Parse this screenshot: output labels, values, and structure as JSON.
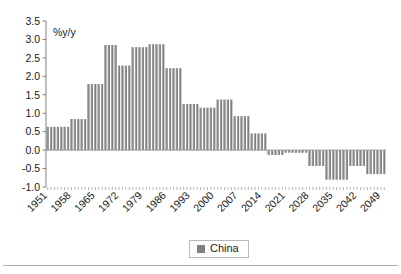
{
  "chart_data": {
    "type": "bar",
    "title": "",
    "subtitle": "",
    "xlabel": "",
    "ylabel": "%y/y",
    "ylim": [
      -1.0,
      3.5
    ],
    "ytick_labels": [
      "3.5",
      "3.0",
      "2.5",
      "2.0",
      "1.5",
      "1.0",
      "0.5",
      "0.0",
      "-0.5",
      "-1.0"
    ],
    "ytick_values": [
      3.5,
      3.0,
      2.5,
      2.0,
      1.5,
      1.0,
      0.5,
      0.0,
      -0.5,
      -1.0
    ],
    "xtick_labels": [
      "1951",
      "1958",
      "1965",
      "1972",
      "1979",
      "1986",
      "1993",
      "2000",
      "2007",
      "2014",
      "2021",
      "2028",
      "2035",
      "2042",
      "2049"
    ],
    "xtick_values": [
      1951,
      1958,
      1965,
      1972,
      1979,
      1986,
      1993,
      2000,
      2007,
      2014,
      2021,
      2028,
      2035,
      2042,
      2049
    ],
    "grid": false,
    "legend_position": "bottom",
    "legend": [
      {
        "name": "China",
        "color": "#808080"
      }
    ],
    "series": [
      {
        "name": "China",
        "color": "#808080",
        "x": [
          1951,
          1952,
          1953,
          1954,
          1955,
          1956,
          1957,
          1958,
          1959,
          1960,
          1961,
          1962,
          1963,
          1964,
          1965,
          1966,
          1967,
          1968,
          1969,
          1970,
          1971,
          1972,
          1973,
          1974,
          1975,
          1976,
          1977,
          1978,
          1979,
          1980,
          1981,
          1982,
          1983,
          1984,
          1985,
          1986,
          1987,
          1988,
          1989,
          1990,
          1991,
          1992,
          1993,
          1994,
          1995,
          1996,
          1997,
          1998,
          1999,
          2000,
          2001,
          2002,
          2003,
          2004,
          2005,
          2006,
          2007,
          2008,
          2009,
          2010,
          2011,
          2012,
          2013,
          2014,
          2015,
          2016,
          2017,
          2018,
          2019,
          2020,
          2021,
          2022,
          2023,
          2024,
          2025,
          2026,
          2027,
          2028,
          2029,
          2030,
          2031,
          2032,
          2033,
          2034,
          2035,
          2036,
          2037,
          2038,
          2039,
          2040,
          2041,
          2042,
          2043,
          2044,
          2045,
          2046,
          2047,
          2048,
          2049,
          2050
        ],
        "values": [
          0.63,
          0.63,
          0.63,
          0.63,
          0.63,
          0.63,
          0.63,
          0.84,
          0.84,
          0.84,
          0.84,
          0.84,
          1.79,
          1.79,
          1.79,
          1.79,
          1.79,
          2.85,
          2.85,
          2.85,
          2.85,
          2.29,
          2.29,
          2.29,
          2.29,
          2.79,
          2.79,
          2.79,
          2.79,
          2.79,
          2.87,
          2.87,
          2.87,
          2.87,
          2.87,
          2.22,
          2.22,
          2.22,
          2.22,
          2.22,
          1.25,
          1.25,
          1.25,
          1.25,
          1.25,
          1.15,
          1.15,
          1.15,
          1.15,
          1.15,
          1.37,
          1.37,
          1.37,
          1.37,
          1.37,
          0.92,
          0.92,
          0.92,
          0.92,
          0.92,
          0.45,
          0.45,
          0.45,
          0.45,
          0.45,
          -0.13,
          -0.13,
          -0.13,
          -0.13,
          -0.13,
          -0.07,
          -0.07,
          -0.07,
          -0.07,
          -0.07,
          -0.07,
          -0.07,
          -0.43,
          -0.43,
          -0.43,
          -0.43,
          -0.43,
          -0.8,
          -0.8,
          -0.8,
          -0.8,
          -0.8,
          -0.8,
          -0.8,
          -0.43,
          -0.43,
          -0.43,
          -0.43,
          -0.43,
          -0.65,
          -0.65,
          -0.65,
          -0.65,
          -0.65,
          -0.65
        ]
      }
    ]
  },
  "legend_ui": {
    "label": "China"
  },
  "axis": {
    "unit_label": "%y/y"
  }
}
